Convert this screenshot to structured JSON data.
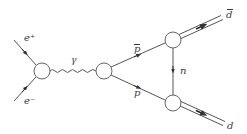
{
  "diagram": {
    "colors": {
      "line": "#555555",
      "text": "#3a3a3a",
      "vertex_fill": "#ffffff"
    },
    "labels": {
      "e_plus": "e⁺",
      "e_minus": "e⁻",
      "photon": "γ",
      "pbar": "p",
      "p": "p",
      "n": "n",
      "dbar": "d",
      "d": "d"
    },
    "vertices": [
      {
        "id": "v1",
        "x": 42,
        "y": 71,
        "r": 8
      },
      {
        "id": "v2",
        "x": 104,
        "y": 71,
        "r": 8
      },
      {
        "id": "v3",
        "x": 173,
        "y": 40,
        "r": 8
      },
      {
        "id": "v4",
        "x": 173,
        "y": 103,
        "r": 8
      }
    ],
    "edges": [
      {
        "from": "e+ in",
        "to": "v1",
        "type": "fermion",
        "label": "e⁺"
      },
      {
        "from": "e- in",
        "to": "v1",
        "type": "fermion",
        "label": "e⁻"
      },
      {
        "from": "v1",
        "to": "v2",
        "type": "photon",
        "label": "γ"
      },
      {
        "from": "v2",
        "to": "v3",
        "type": "fermion",
        "label": "p̄"
      },
      {
        "from": "v2",
        "to": "v4",
        "type": "fermion",
        "label": "p"
      },
      {
        "from": "v3",
        "to": "v4",
        "type": "fermion",
        "label": "n"
      },
      {
        "from": "v3",
        "to": "out",
        "type": "double",
        "label": "d̄"
      },
      {
        "from": "v4",
        "to": "out",
        "type": "double",
        "label": "d"
      }
    ]
  }
}
